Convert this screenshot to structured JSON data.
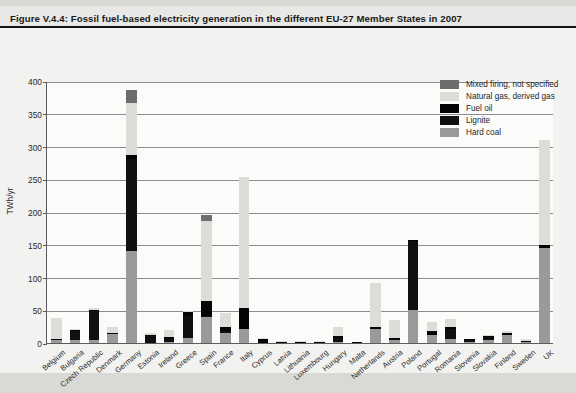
{
  "figure": {
    "title": "Figure V.4.4: Fossil fuel-based electricity generation in the different EU-27 Member States in 2007",
    "source": "Source: Auer et al. (2007)"
  },
  "colors": {
    "hard_coal": "#9a9a9a",
    "lignite": "#101010",
    "fuel_oil": "#050505",
    "natural_gas": "#dcdcd8",
    "mixed": "#6d6d6d",
    "background": "#d9d9d6",
    "canvas": "#f2f2f0",
    "axis": "#5b5b5b"
  },
  "chart_data": {
    "type": "bar",
    "stacked": true,
    "title": "Fossil fuel-based electricity generation in the different EU-27 Member States in 2007",
    "xlabel": "",
    "ylabel": "TWh/yr",
    "ylim": [
      0,
      400
    ],
    "yticks": [
      0,
      50,
      100,
      150,
      200,
      250,
      300,
      350,
      400
    ],
    "grid": true,
    "legend_position": "top-right",
    "categories": [
      "Belgium",
      "Bulgaria",
      "Czech Republic",
      "Denmark",
      "Germany",
      "Estonia",
      "Ireland",
      "Greece",
      "Spain",
      "France",
      "Italy",
      "Cyprus",
      "Latvia",
      "Lithuania",
      "Luxembourg",
      "Hungary",
      "Malta",
      "Netherlands",
      "Austria",
      "Poland",
      "Portugal",
      "Romania",
      "Slovenia",
      "Slovakia",
      "Finland",
      "Sweden",
      "UK"
    ],
    "series": [
      {
        "name": "Hard coal",
        "key": "hard_coal",
        "values": [
          4,
          4,
          5,
          14,
          140,
          0,
          2,
          8,
          40,
          16,
          22,
          0,
          0,
          0,
          0,
          2,
          0,
          22,
          4,
          50,
          12,
          6,
          1,
          4,
          12,
          1,
          145
        ]
      },
      {
        "name": "Lignite",
        "key": "lignite",
        "values": [
          0,
          14,
          44,
          0,
          141,
          11,
          5,
          33,
          2,
          1,
          0,
          0,
          0,
          0,
          0,
          6,
          0,
          0,
          1,
          105,
          0,
          16,
          3,
          5,
          0,
          0,
          0
        ]
      },
      {
        "name": "Fuel oil",
        "key": "fuel_oil",
        "values": [
          1,
          1,
          1,
          2,
          6,
          1,
          2,
          6,
          22,
          7,
          32,
          6,
          1,
          1,
          1,
          2,
          2,
          2,
          1,
          2,
          7,
          1,
          1,
          1,
          3,
          1,
          5
        ]
      },
      {
        "name": "Natural gas, derived gas",
        "key": "natural_gas",
        "values": [
          32,
          2,
          2,
          9,
          80,
          1,
          11,
          1,
          122,
          21,
          199,
          1,
          2,
          2,
          2,
          15,
          0,
          67,
          27,
          0,
          13,
          13,
          0,
          2,
          3,
          2,
          160
        ]
      },
      {
        "name": "Mixed firing, not specified",
        "key": "mixed",
        "values": [
          0,
          0,
          0,
          0,
          19,
          0,
          0,
          0,
          9,
          0,
          0,
          0,
          0,
          0,
          0,
          0,
          0,
          0,
          0,
          0,
          0,
          0,
          0,
          0,
          0,
          0,
          0
        ]
      }
    ],
    "totals": [
      37,
      21,
      52,
      25,
      386,
      13,
      20,
      48,
      195,
      45,
      253,
      7,
      3,
      3,
      3,
      25,
      2,
      91,
      33,
      157,
      32,
      36,
      5,
      12,
      18,
      4,
      310
    ]
  },
  "legend": {
    "entries": [
      {
        "label": "Mixed firing, not specified",
        "key": "mixed"
      },
      {
        "label": "Natural gas, derived gas",
        "key": "natural_gas"
      },
      {
        "label": "Fuel oil",
        "key": "fuel_oil"
      },
      {
        "label": "Lignite",
        "key": "lignite"
      },
      {
        "label": "Hard coal",
        "key": "hard_coal"
      }
    ]
  }
}
